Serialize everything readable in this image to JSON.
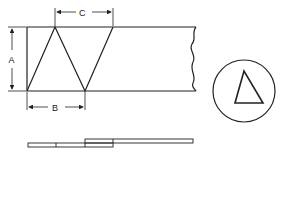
{
  "diagram": {
    "title": "",
    "labels": {
      "dim_a": "A",
      "dim_b": "B",
      "dim_c": "C"
    },
    "views": [
      {
        "name": "plan-view",
        "description": "strip with alternating triangular cuts and broken right edge"
      },
      {
        "name": "detail-circle",
        "description": "circle containing a single triangle"
      },
      {
        "name": "side-view",
        "description": "two overlapping thin strips"
      }
    ],
    "colors": {
      "stroke": "#222222",
      "background": "#ffffff"
    }
  }
}
